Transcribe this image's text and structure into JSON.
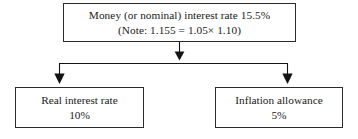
{
  "diagram": {
    "type": "flowchart",
    "orientation": "top-down",
    "nodes": {
      "money": {
        "name": "money-interest-rate",
        "line_1": "Money (or nominal) interest rate 15.5%",
        "line_2": "(Note:  1.155 = 1.05×  1.10)"
      },
      "real": {
        "name": "real-interest-rate",
        "line_1": "Real interest rate",
        "line_2": "10%"
      },
      "inflation": {
        "name": "inflation-allowance",
        "line_1": "Inflation allowance",
        "line_2": "5%"
      }
    },
    "connectors": [
      {
        "name": "money-to-split",
        "from": "money",
        "to": "split-bar",
        "arrowhead": "down"
      },
      {
        "name": "split-to-real",
        "from": "split-bar",
        "to": "real",
        "arrowhead": "down"
      },
      {
        "name": "split-to-inflation",
        "from": "split-bar",
        "to": "inflation",
        "arrowhead": "down"
      }
    ],
    "colors": {
      "box_border": "#2b2b2b",
      "connector": "#141414",
      "background": "#ffffff",
      "text": "#1a1a1a"
    }
  }
}
